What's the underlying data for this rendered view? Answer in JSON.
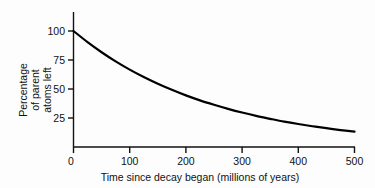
{
  "chart_data": {
    "type": "line",
    "title": "",
    "subtitle": "",
    "xlabel": "Time since decay began (millions of years)",
    "ylabel": "Percentage of parent atoms left",
    "ylabel_lines": [
      "Percentage",
      "of parent",
      "atoms left"
    ],
    "xlim": [
      0,
      500
    ],
    "ylim": [
      0,
      100
    ],
    "xticks": [
      0,
      100,
      200,
      300,
      400,
      500
    ],
    "xtick_labels": [
      "0",
      "100",
      "200",
      "300",
      "400",
      "500"
    ],
    "yticks": [
      0,
      25,
      50,
      75,
      100
    ],
    "ytick_labels": [
      "0",
      "25",
      "50",
      "75",
      "100"
    ],
    "grid": false,
    "legend": false,
    "legend_position": "none",
    "series": [
      {
        "name": "Parent atoms remaining",
        "color": "#000000",
        "half_life_myr": 170,
        "x": [
          0,
          25,
          50,
          75,
          100,
          125,
          150,
          175,
          200,
          225,
          250,
          275,
          300,
          325,
          350,
          375,
          400,
          425,
          450,
          475,
          500
        ],
        "values": [
          100,
          90.4,
          81.7,
          73.8,
          66.7,
          60.3,
          54.5,
          49.3,
          44.5,
          40.2,
          36.4,
          32.9,
          29.7,
          26.8,
          24.3,
          21.9,
          19.8,
          17.9,
          16.2,
          14.6,
          13.2
        ]
      }
    ],
    "annotations": []
  },
  "axes": {
    "x_axis_name": "time-axis",
    "y_axis_name": "percentage-axis"
  }
}
